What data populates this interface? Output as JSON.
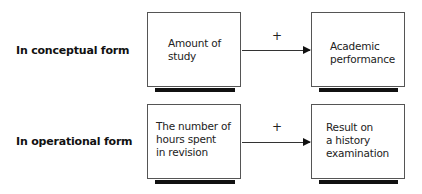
{
  "rows": [
    {
      "label": "In conceptual form",
      "left_box": "Amount of\nstudy",
      "relation": "+",
      "right_box": "Academic\nperformance"
    },
    {
      "label": "In operational form",
      "left_box": "The number of\nhours spent\nin revision",
      "relation": "+",
      "right_box": "Result on\na history\nexamination"
    }
  ]
}
